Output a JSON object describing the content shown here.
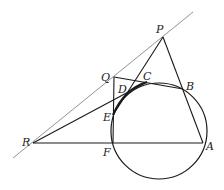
{
  "diagram": {
    "colors": {
      "stroke": "#1a1a1a",
      "tangent": "#777777",
      "background": "#ffffff"
    },
    "circle": {
      "cx": 159,
      "cy": 131,
      "r": 48
    },
    "points": {
      "P": {
        "x": 163,
        "y": 37,
        "label": "P",
        "lx": 156,
        "ly": 33
      },
      "Q": {
        "x": 114,
        "y": 77,
        "label": "Q",
        "lx": 101,
        "ly": 81
      },
      "C": {
        "x": 147,
        "y": 82,
        "label": "C",
        "lx": 143,
        "ly": 80
      },
      "B": {
        "x": 183,
        "y": 89,
        "label": "B",
        "lx": 186,
        "ly": 90
      },
      "D": {
        "x": 126,
        "y": 95,
        "label": "D",
        "lx": 118,
        "ly": 93
      },
      "E": {
        "x": 113,
        "y": 115,
        "label": "E",
        "lx": 103,
        "ly": 121
      },
      "R": {
        "x": 33,
        "y": 143,
        "label": "R",
        "lx": 22,
        "ly": 146
      },
      "F": {
        "x": 113,
        "y": 143,
        "label": "F",
        "lx": 103,
        "ly": 156
      },
      "A": {
        "x": 203,
        "y": 143,
        "label": "A",
        "lx": 206,
        "ly": 150
      }
    },
    "tangent_line": {
      "x1": 13,
      "y1": 158,
      "x2": 193,
      "y2": 12
    }
  }
}
